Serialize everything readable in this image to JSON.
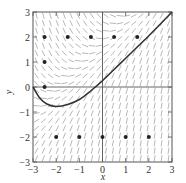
{
  "chart_data": {
    "type": "slope-field",
    "title": "",
    "xlabel": "x",
    "ylabel": "y",
    "xlim": [
      -3,
      3
    ],
    "ylim": [
      -3,
      3
    ],
    "x_ticks": [
      "-3",
      "-2",
      "-1",
      "0",
      "1",
      "2",
      "3"
    ],
    "y_ticks": [
      "-3",
      "-2",
      "-1",
      "0",
      "1",
      "2",
      "3"
    ],
    "grid": false,
    "points": [
      {
        "x": -2.5,
        "y": 2
      },
      {
        "x": -1.5,
        "y": 2
      },
      {
        "x": -0.5,
        "y": 2
      },
      {
        "x": 0.5,
        "y": 2
      },
      {
        "x": 1.5,
        "y": 2
      },
      {
        "x": -2.5,
        "y": 1
      },
      {
        "x": -2.5,
        "y": 0
      },
      {
        "x": -2,
        "y": -2
      },
      {
        "x": -1,
        "y": -2
      },
      {
        "x": 0,
        "y": -2
      },
      {
        "x": 1,
        "y": -2
      },
      {
        "x": 2,
        "y": -2
      }
    ],
    "solution_curve": [
      {
        "x": -3,
        "y": 0
      },
      {
        "x": -2.7,
        "y": -0.45
      },
      {
        "x": -2.4,
        "y": -0.68
      },
      {
        "x": -2,
        "y": -0.78
      },
      {
        "x": -1.5,
        "y": -0.7
      },
      {
        "x": -1,
        "y": -0.5
      },
      {
        "x": -0.5,
        "y": -0.15
      },
      {
        "x": 0,
        "y": 0.25
      },
      {
        "x": 0.5,
        "y": 0.7
      },
      {
        "x": 1,
        "y": 1.15
      },
      {
        "x": 1.5,
        "y": 1.6
      },
      {
        "x": 2,
        "y": 2.05
      },
      {
        "x": 2.5,
        "y": 2.52
      },
      {
        "x": 3,
        "y": 3
      }
    ],
    "field_grid_step": 0.3
  }
}
